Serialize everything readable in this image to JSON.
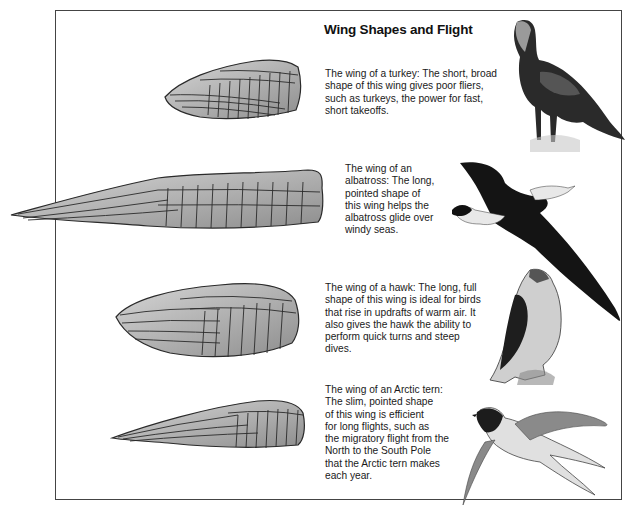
{
  "title": "Wing Shapes and Flight",
  "sections": [
    {
      "bird": "turkey",
      "wing_icon": "turkey-wing-illustration",
      "bird_icon": "turkey-illustration",
      "caption_lines": [
        "The wing of a turkey: The short, broad",
        "shape of this wing gives poor fliers,",
        "such as turkeys, the power for fast,",
        "short takeoffs."
      ]
    },
    {
      "bird": "albatross",
      "wing_icon": "albatross-wing-illustration",
      "bird_icon": "albatross-illustration",
      "caption_lines": [
        "The wing of an",
        "albatross: The long,",
        "pointed shape of",
        "this wing helps the",
        "albatross glide over",
        "windy seas."
      ]
    },
    {
      "bird": "hawk",
      "wing_icon": "hawk-wing-illustration",
      "bird_icon": "hawk-illustration",
      "caption_lines": [
        "The wing of a hawk: The long, full",
        "shape of this wing is ideal for birds",
        "that rise in updrafts of warm air. It",
        "also gives the hawk the ability to",
        "perform quick turns and steep",
        "dives."
      ]
    },
    {
      "bird": "arctic tern",
      "wing_icon": "arctic-tern-wing-illustration",
      "bird_icon": "arctic-tern-illustration",
      "caption_lines": [
        "The wing of an Arctic tern:",
        "The slim, pointed shape",
        "of this wing is efficient",
        "for long flights, such as",
        "the migratory flight from the",
        "North to the South Pole",
        "that the Arctic tern makes",
        "each year."
      ]
    }
  ],
  "colors": {
    "frame": "#444444",
    "wing_fill": "#b8b8b8",
    "wing_outline": "#2a2a2a",
    "bird_dark": "#1a1a1a"
  }
}
